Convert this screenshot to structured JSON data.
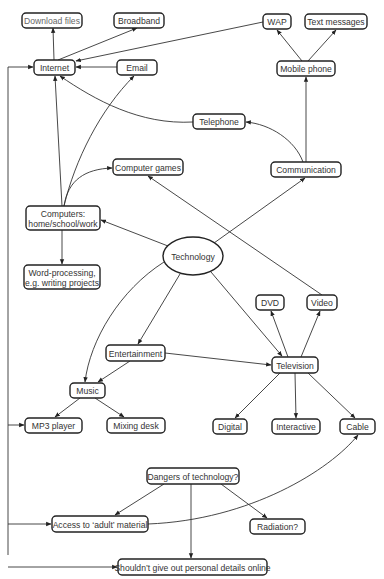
{
  "diagram": {
    "type": "mind-map",
    "central_topic": "Technology",
    "nodes": [
      {
        "id": "download",
        "label": [
          "Download files"
        ]
      },
      {
        "id": "broadband",
        "label": [
          "Broadband"
        ]
      },
      {
        "id": "wap",
        "label": [
          "WAP"
        ]
      },
      {
        "id": "text",
        "label": [
          "Text messages"
        ]
      },
      {
        "id": "internet",
        "label": [
          "Internet"
        ]
      },
      {
        "id": "email",
        "label": [
          "Email"
        ]
      },
      {
        "id": "mobile",
        "label": [
          "Mobile phone"
        ]
      },
      {
        "id": "telephone",
        "label": [
          "Telephone"
        ]
      },
      {
        "id": "games",
        "label": [
          "Computer games"
        ]
      },
      {
        "id": "communication",
        "label": [
          "Communication"
        ]
      },
      {
        "id": "computers",
        "label": [
          "Computers:",
          "home/school/work"
        ]
      },
      {
        "id": "technology",
        "label": [
          "Technology"
        ],
        "shape": "ellipse"
      },
      {
        "id": "wordproc",
        "label": [
          "Word-processing,",
          "e.g. writing projects"
        ]
      },
      {
        "id": "dvd",
        "label": [
          "DVD"
        ]
      },
      {
        "id": "video",
        "label": [
          "Video"
        ]
      },
      {
        "id": "entertainment",
        "label": [
          "Entertainment"
        ]
      },
      {
        "id": "television",
        "label": [
          "Television"
        ]
      },
      {
        "id": "music",
        "label": [
          "Music"
        ]
      },
      {
        "id": "mp3",
        "label": [
          "MP3 player"
        ]
      },
      {
        "id": "mixing",
        "label": [
          "Mixing desk"
        ]
      },
      {
        "id": "digital",
        "label": [
          "Digital"
        ]
      },
      {
        "id": "interactive",
        "label": [
          "Interactive"
        ]
      },
      {
        "id": "cable",
        "label": [
          "Cable"
        ]
      },
      {
        "id": "dangers",
        "label": [
          "Dangers of technology?"
        ]
      },
      {
        "id": "access",
        "label": [
          "Access to ‘adult’ material"
        ]
      },
      {
        "id": "radiation",
        "label": [
          "Radiation?"
        ]
      },
      {
        "id": "personal",
        "label": [
          "Shouldn’t give out personal details online"
        ]
      }
    ],
    "edges": [
      {
        "from": "internet",
        "to": "download"
      },
      {
        "from": "internet",
        "to": "broadband"
      },
      {
        "from": "wap",
        "to": "internet"
      },
      {
        "from": "email",
        "to": "internet"
      },
      {
        "from": "mobile",
        "to": "wap"
      },
      {
        "from": "mobile",
        "to": "text"
      },
      {
        "from": "telephone",
        "to": "internet"
      },
      {
        "from": "communication",
        "to": "mobile"
      },
      {
        "from": "communication",
        "to": "telephone"
      },
      {
        "from": "computers",
        "to": "internet"
      },
      {
        "from": "computers",
        "to": "email"
      },
      {
        "from": "computers",
        "to": "games"
      },
      {
        "from": "computers",
        "to": "wordproc"
      },
      {
        "from": "technology",
        "to": "computers"
      },
      {
        "from": "technology",
        "to": "communication"
      },
      {
        "from": "technology",
        "to": "entertainment"
      },
      {
        "from": "technology",
        "to": "television"
      },
      {
        "from": "technology",
        "to": "music"
      },
      {
        "from": "video",
        "to": "games"
      },
      {
        "from": "television",
        "to": "dvd"
      },
      {
        "from": "television",
        "to": "video"
      },
      {
        "from": "television",
        "to": "digital"
      },
      {
        "from": "television",
        "to": "interactive"
      },
      {
        "from": "television",
        "to": "cable"
      },
      {
        "from": "entertainment",
        "to": "television"
      },
      {
        "from": "entertainment",
        "to": "music"
      },
      {
        "from": "music",
        "to": "mp3"
      },
      {
        "from": "music",
        "to": "mixing"
      },
      {
        "from": "dangers",
        "to": "access"
      },
      {
        "from": "dangers",
        "to": "radiation"
      },
      {
        "from": "dangers",
        "to": "personal"
      },
      {
        "from": "access",
        "to": "cable"
      },
      {
        "from": "left-bus",
        "to": "internet"
      },
      {
        "from": "left-bus",
        "to": "mp3"
      },
      {
        "from": "left-bus",
        "to": "access"
      },
      {
        "from": "left-bus",
        "to": "personal"
      }
    ]
  }
}
